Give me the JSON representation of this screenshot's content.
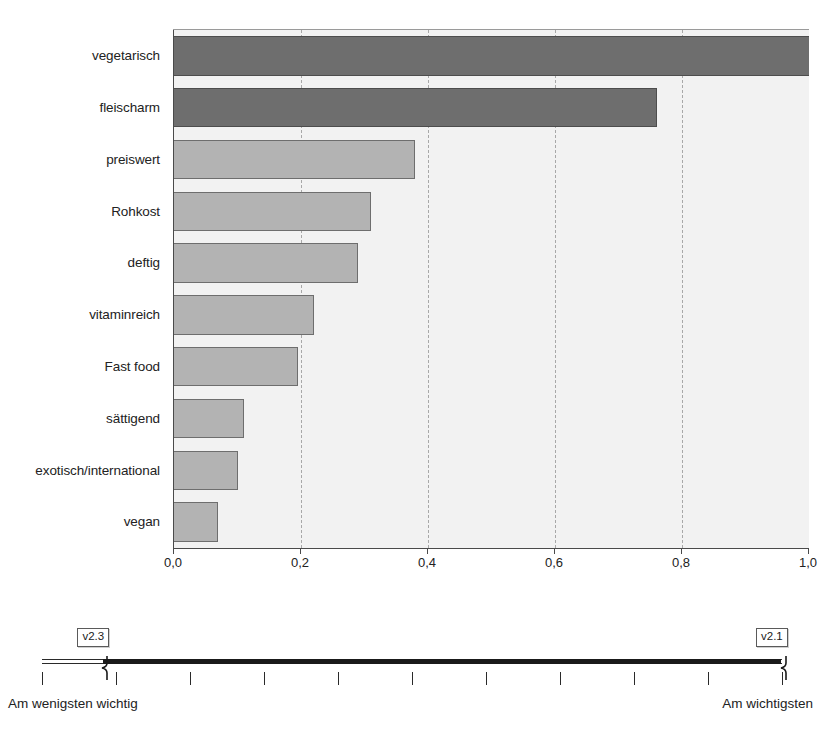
{
  "chart_data": {
    "type": "bar",
    "orientation": "horizontal",
    "title": "",
    "xlabel": "",
    "ylabel": "",
    "xlim": [
      0.0,
      1.0
    ],
    "grid": true,
    "gridlines": [
      0.2,
      0.4,
      0.6,
      0.8
    ],
    "legend_position": "none",
    "categories": [
      "vegetarisch",
      "fleischarm",
      "preiswert",
      "Rohkost",
      "deftig",
      "vitaminreich",
      "Fast food",
      "sättigend",
      "exotisch/international",
      "vegan"
    ],
    "values": [
      1.0,
      0.76,
      0.38,
      0.31,
      0.29,
      0.22,
      0.195,
      0.11,
      0.1,
      0.07
    ],
    "bar_styles": [
      "dark",
      "dark",
      "light",
      "light",
      "light",
      "light",
      "light",
      "light",
      "light",
      "light"
    ],
    "xticks": [
      {
        "value": 0.0,
        "label": "0,0"
      },
      {
        "value": 0.2,
        "label": "0,2"
      },
      {
        "value": 0.4,
        "label": "0,4"
      },
      {
        "value": 0.6,
        "label": "0,6"
      },
      {
        "value": 0.8,
        "label": "0,8"
      },
      {
        "value": 1.0,
        "label": "1,0"
      }
    ],
    "colors": {
      "bar_dark": "#6e6e6e",
      "bar_light": "#b3b3b3",
      "plot_background": "#f2f2f2",
      "axis": "#4a4a4a",
      "gridline": "#a8a8a8"
    }
  },
  "scale": {
    "left_label": "Am wenigsten wichtig",
    "right_label": "Am wichtigsten",
    "handles": [
      {
        "id": "left-handle",
        "label": "v2.3",
        "position_pct": 8.3
      },
      {
        "id": "right-handle",
        "label": "v2.1",
        "position_pct": 100.0
      }
    ],
    "tick_count": 11,
    "track_color": "#1a1a1a"
  },
  "caption": {
    "text": ""
  }
}
